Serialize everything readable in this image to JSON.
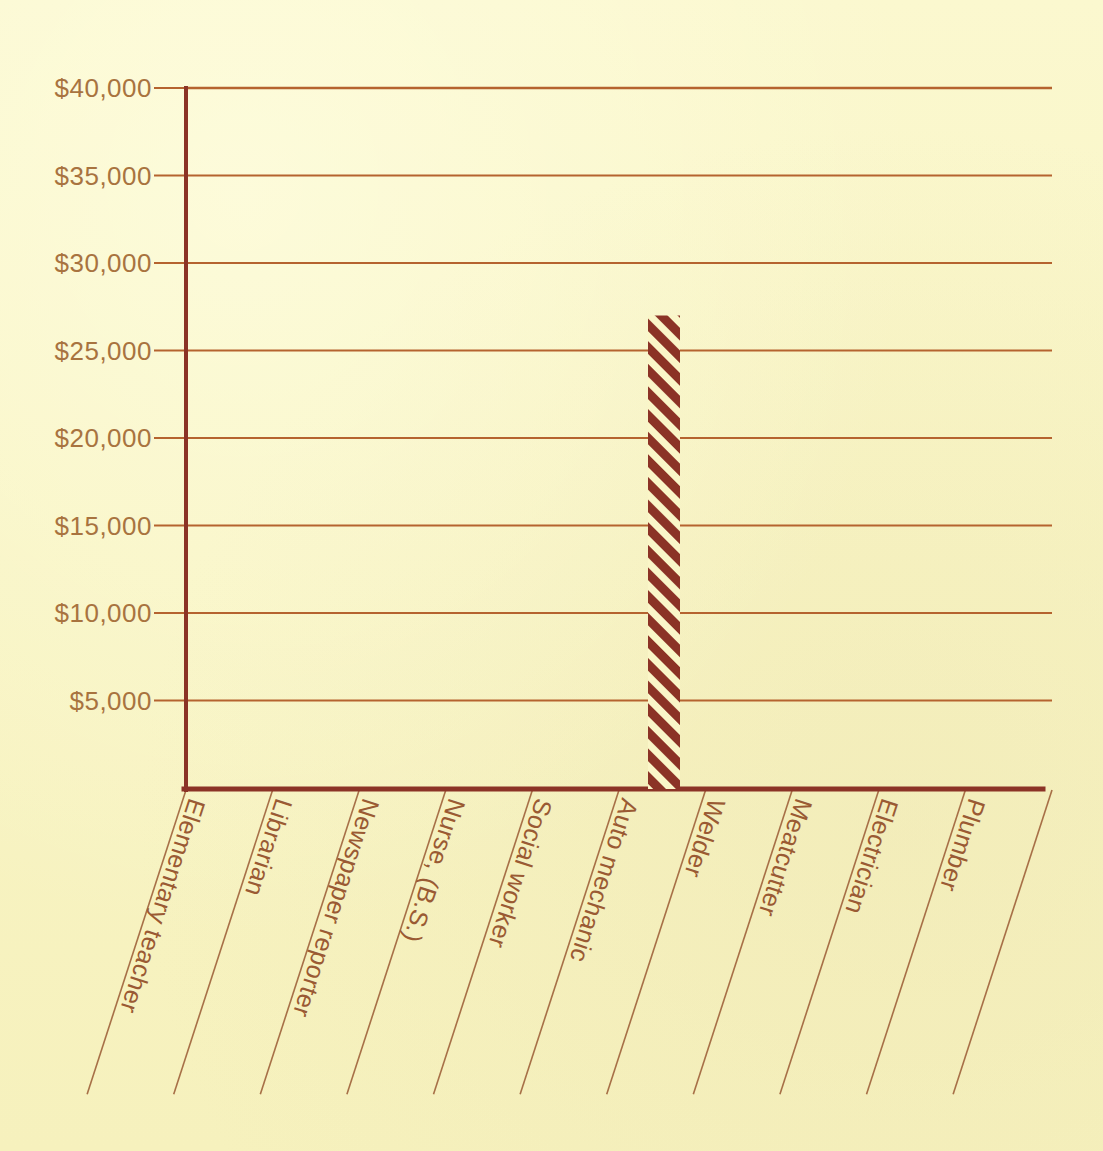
{
  "page": {
    "background_color": "#faf6c8",
    "ink_color": "#9a5a33",
    "gridline_color": "#b5632f",
    "axis_color": "#8b3326",
    "bar_hatch_color": "#8b3326",
    "tick_label_color": "#a8733f"
  },
  "chart_data": {
    "type": "bar",
    "title": "",
    "subtitle": "",
    "xlabel": "",
    "ylabel": "",
    "categories": [
      "Elementary teacher",
      "Librarian",
      "Newspaper reporter",
      "Nurse, (B.S.)",
      "Social worker",
      "Auto mechanic",
      "Welder",
      "Meatcutter",
      "Electrician",
      "Plumber"
    ],
    "values": [
      null,
      null,
      null,
      null,
      null,
      27000,
      null,
      null,
      null,
      null
    ],
    "ylim": [
      0,
      40000
    ],
    "ytick_values": [
      5000,
      10000,
      15000,
      20000,
      25000,
      30000,
      35000,
      40000
    ],
    "ytick_labels": [
      "$5,000",
      "$10,000",
      "$15,000",
      "$20,000",
      "$25,000",
      "$30,000",
      "$35,000",
      "$40,000"
    ],
    "grid": true,
    "legend": false,
    "legend_position": "none",
    "bar_fill": "diagonal-hatch",
    "annotations": []
  },
  "axis_geometry": {
    "plot_left": 186,
    "plot_right": 1052,
    "plot_top": 88,
    "plot_bottom": 788,
    "pixels_per_tick": 88,
    "bar_left": 648,
    "bar_right": 680,
    "bar_top": 312,
    "category_label_angle_deg": 72
  }
}
